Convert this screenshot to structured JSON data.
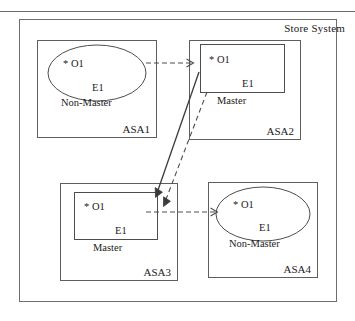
{
  "figure": {
    "outer_frame_label": "Store System",
    "line_color": "#4d4d4d"
  },
  "nodes": [
    {
      "id": "asa1",
      "container_label": "ASA1",
      "shape": "ellipse",
      "object_label": "* O1",
      "entity_label": "E1",
      "role_label": "Non-Master"
    },
    {
      "id": "asa2",
      "container_label": "ASA2",
      "shape": "rectangle",
      "object_label": "* O1",
      "entity_label": "E1",
      "role_label": "Master"
    },
    {
      "id": "asa3",
      "container_label": "ASA3",
      "shape": "rectangle",
      "object_label": "* O1",
      "entity_label": "E1",
      "role_label": "Master"
    },
    {
      "id": "asa4",
      "container_label": "ASA4",
      "shape": "ellipse",
      "object_label": "* O1",
      "entity_label": "E1",
      "role_label": "Non-Master"
    }
  ],
  "edges": [
    {
      "id": "asa1-to-asa2",
      "style": "dashed",
      "from": "asa1",
      "to": "asa2"
    },
    {
      "id": "asa2-to-asa3-solid",
      "style": "solid",
      "from": "asa2",
      "to": "asa3"
    },
    {
      "id": "asa2-to-asa3-dashed",
      "style": "dashed",
      "from": "asa2",
      "to": "asa3"
    },
    {
      "id": "asa3-to-asa4",
      "style": "dashed",
      "from": "asa3",
      "to": "asa4"
    }
  ]
}
